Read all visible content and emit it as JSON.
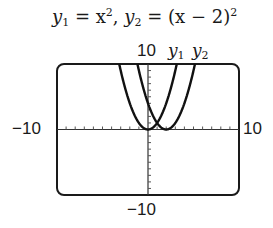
{
  "title": {
    "y1_name": "y",
    "y1_sub": "1",
    "eq1": " = x",
    "eq1_sup": "2",
    "sep": ",  ",
    "y2_name": "y",
    "y2_sub": "2",
    "eq2": " = (x − 2)",
    "eq2_sup": "2"
  },
  "labels": {
    "ymax": "10",
    "ymin": "−10",
    "xmin": "−10",
    "xmax": "10",
    "curve1": "y",
    "curve1_sub": "1",
    "curve2": "y",
    "curve2_sub": "2"
  },
  "chart_data": {
    "type": "line",
    "xlim": [
      -10,
      10
    ],
    "ylim": [
      -10,
      10
    ],
    "xscale": 1,
    "yscale": 1,
    "series": [
      {
        "name": "y1",
        "expression": "x^2",
        "vertex": [
          0,
          0
        ]
      },
      {
        "name": "y2",
        "expression": "(x - 2)^2",
        "vertex": [
          2,
          0
        ]
      }
    ],
    "intersection": [
      1,
      1
    ],
    "legend": "curve labels at top: y1 y2"
  }
}
